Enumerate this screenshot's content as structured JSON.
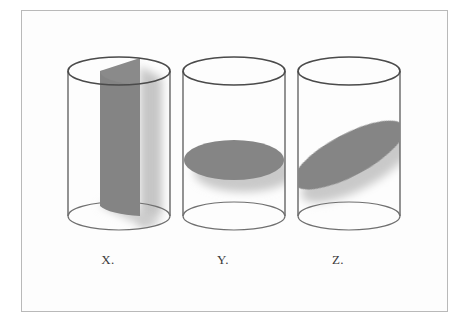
{
  "figure": {
    "background_color": "#ffffff",
    "panel_color": "#fdfdfd",
    "frame_color": "#b9b9b9",
    "outline_color": "#5a5a5a",
    "section_fill_color": "#808080",
    "shadow_color": "#c9c9c9",
    "label_color": "#3a3a3a"
  },
  "cylinders": [
    {
      "id": "x",
      "label": "X.",
      "cross_section": "vertical-rectangular-plane",
      "cross_section_description": "Vertical plane through the axis producing a rectangle",
      "center_x": 119,
      "top_ellipse_cy": 71,
      "bottom_ellipse_cy": 216,
      "rx": 51,
      "ry": 14
    },
    {
      "id": "y",
      "label": "Y.",
      "cross_section": "horizontal-ellipse",
      "cross_section_description": "Horizontal plane perpendicular to the axis producing a circle seen as an ellipse",
      "center_x": 234,
      "top_ellipse_cy": 71,
      "bottom_ellipse_cy": 216,
      "rx": 51,
      "ry": 14,
      "section_cy": 160,
      "section_rx": 50,
      "section_ry": 20
    },
    {
      "id": "z",
      "label": "Z.",
      "cross_section": "oblique-ellipse",
      "cross_section_description": "Oblique plane producing a tilted ellipse",
      "center_x": 349,
      "top_ellipse_cy": 71,
      "bottom_ellipse_cy": 216,
      "rx": 51,
      "ry": 14,
      "section_cy": 155,
      "section_rx": 62,
      "section_ry": 21,
      "section_rotation_deg": -28
    }
  ],
  "labels": {
    "x": "X.",
    "y": "Y.",
    "z": "Z."
  }
}
